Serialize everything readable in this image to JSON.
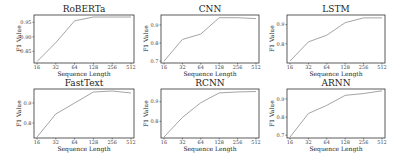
{
  "chart_data": [
    {
      "type": "line",
      "title": "RoBERTa",
      "xlabel": "Sequence Length",
      "ylabel": "F1 Value",
      "x": [
        16,
        32,
        64,
        128,
        256,
        512
      ],
      "xticks": [
        "16",
        "32",
        "64",
        "128",
        "256",
        "512"
      ],
      "yticks": [
        0.85,
        0.9,
        0.95
      ],
      "ytick_labels": [
        "0.85",
        "0.90",
        "0.95"
      ],
      "ylim": [
        0.81,
        0.975
      ],
      "series": [
        {
          "name": "RoBERTa",
          "values": [
            0.815,
            0.88,
            0.955,
            0.968,
            0.968,
            0.968
          ]
        }
      ],
      "grid": false
    },
    {
      "type": "line",
      "title": "CNN",
      "xlabel": "Sequence Length",
      "ylabel": "F1 Value",
      "x": [
        16,
        32,
        64,
        128,
        256,
        512
      ],
      "xticks": [
        "16",
        "32",
        "64",
        "128",
        "256",
        "512"
      ],
      "yticks": [
        0.7,
        0.8,
        0.9
      ],
      "ytick_labels": [
        "0.7",
        "0.8",
        "0.9"
      ],
      "ylim": [
        0.69,
        0.955
      ],
      "series": [
        {
          "name": "CNN",
          "values": [
            0.7,
            0.82,
            0.85,
            0.94,
            0.94,
            0.935
          ]
        }
      ],
      "grid": false
    },
    {
      "type": "line",
      "title": "LSTM",
      "xlabel": "Sequence Length",
      "ylabel": "F1 Value",
      "x": [
        16,
        32,
        64,
        128,
        256,
        512
      ],
      "xticks": [
        "16",
        "32",
        "64",
        "128",
        "256",
        "512"
      ],
      "yticks": [
        0.8,
        0.9
      ],
      "ytick_labels": [
        "0.8",
        "0.9"
      ],
      "ylim": [
        0.7,
        0.95
      ],
      "series": [
        {
          "name": "LSTM",
          "values": [
            0.71,
            0.81,
            0.845,
            0.91,
            0.935,
            0.935
          ]
        }
      ],
      "grid": false
    },
    {
      "type": "line",
      "title": "FastText",
      "xlabel": "Sequence Length",
      "ylabel": "F1 Value",
      "x": [
        16,
        32,
        64,
        128,
        256,
        512
      ],
      "xticks": [
        "16",
        "32",
        "64",
        "128",
        "256",
        "512"
      ],
      "yticks": [
        0.8,
        0.9
      ],
      "ytick_labels": [
        "0.8",
        "0.9"
      ],
      "ylim": [
        0.725,
        0.97
      ],
      "series": [
        {
          "name": "FastText",
          "values": [
            0.73,
            0.845,
            0.9,
            0.955,
            0.96,
            0.95
          ]
        }
      ],
      "grid": false
    },
    {
      "type": "line",
      "title": "RCNN",
      "xlabel": "Sequence Length",
      "ylabel": "F1 Value",
      "x": [
        16,
        32,
        64,
        128,
        256,
        512
      ],
      "xticks": [
        "16",
        "32",
        "64",
        "128",
        "256",
        "512"
      ],
      "yticks": [
        0.8,
        0.9
      ],
      "ytick_labels": [
        "0.8",
        "0.9"
      ],
      "ylim": [
        0.715,
        0.965
      ],
      "series": [
        {
          "name": "RCNN",
          "values": [
            0.72,
            0.82,
            0.895,
            0.945,
            0.95,
            0.952
          ]
        }
      ],
      "grid": false
    },
    {
      "type": "line",
      "title": "ARNN",
      "xlabel": "Sequence Length",
      "ylabel": "F1 Value",
      "x": [
        16,
        32,
        64,
        128,
        256,
        512
      ],
      "xticks": [
        "16",
        "32",
        "64",
        "128",
        "256",
        "512"
      ],
      "yticks": [
        0.7,
        0.8,
        0.9
      ],
      "ytick_labels": [
        "0.7",
        "0.8",
        "0.9"
      ],
      "ylim": [
        0.685,
        0.955
      ],
      "series": [
        {
          "name": "ARNN",
          "values": [
            0.69,
            0.82,
            0.865,
            0.92,
            0.93,
            0.945
          ]
        }
      ],
      "grid": false
    }
  ],
  "style": {
    "line_color": "#9a9a9a",
    "frame_color": "#333333"
  }
}
